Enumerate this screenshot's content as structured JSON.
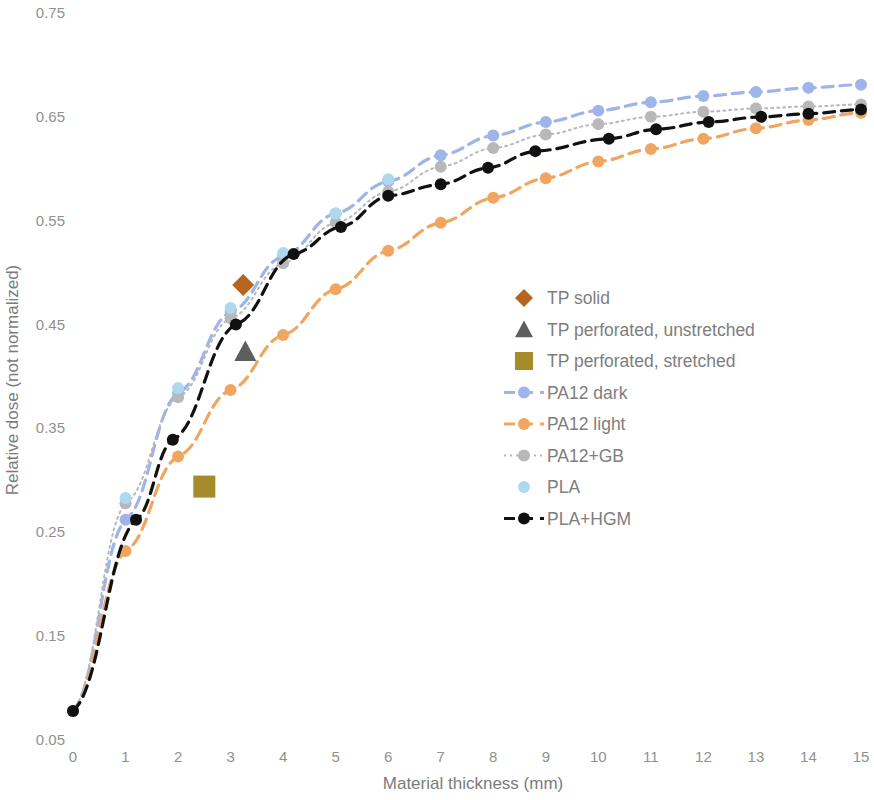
{
  "chart_data": {
    "type": "scatter",
    "title": "",
    "xlabel": "Material thickness (mm)",
    "ylabel": "Relative dose  (not normalized)",
    "xlim": [
      0,
      15
    ],
    "ylim": [
      0.05,
      0.75
    ],
    "xticks": [
      "0",
      "1",
      "2",
      "3",
      "4",
      "5",
      "6",
      "7",
      "8",
      "9",
      "10",
      "11",
      "12",
      "13",
      "14",
      "15"
    ],
    "yticks": [
      "0.05",
      "0.15",
      "0.25",
      "0.35",
      "0.45",
      "0.55",
      "0.65",
      "0.75"
    ],
    "grid": false,
    "legend_position": "center",
    "series": [
      {
        "name": "TP solid",
        "marker": "diamond",
        "color": "#b5651d",
        "line": "none",
        "points": [
          [
            3.24,
            0.488
          ]
        ]
      },
      {
        "name": "TP perforated, unstretched",
        "marker": "triangle",
        "color": "#5e5e5e",
        "line": "none",
        "points": [
          [
            3.28,
            0.424
          ]
        ]
      },
      {
        "name": "TP perforated, stretched",
        "marker": "square",
        "color": "#a68b2a",
        "line": "none",
        "points": [
          [
            2.5,
            0.294
          ]
        ]
      },
      {
        "name": "PA12 dark",
        "marker": "circle",
        "color": "#9fb4e8",
        "line": "dashed",
        "points": [
          [
            0.0,
            0.078
          ],
          [
            1.0,
            0.262
          ],
          [
            2.0,
            0.384
          ],
          [
            3.0,
            0.462
          ],
          [
            4.0,
            0.516
          ],
          [
            5.0,
            0.557
          ],
          [
            6.0,
            0.588
          ],
          [
            7.0,
            0.613
          ],
          [
            8.0,
            0.632
          ],
          [
            9.0,
            0.645
          ],
          [
            10.0,
            0.656
          ],
          [
            11.0,
            0.664
          ],
          [
            12.0,
            0.67
          ],
          [
            13.0,
            0.674
          ],
          [
            14.0,
            0.678
          ],
          [
            15.0,
            0.681
          ]
        ]
      },
      {
        "name": "PA12 light",
        "marker": "circle",
        "color": "#f0a661",
        "line": "dashed",
        "points": [
          [
            0.0,
            0.078
          ],
          [
            1.0,
            0.232
          ],
          [
            2.0,
            0.323
          ],
          [
            3.0,
            0.387
          ],
          [
            4.0,
            0.44
          ],
          [
            5.0,
            0.484
          ],
          [
            6.0,
            0.521
          ],
          [
            7.0,
            0.548
          ],
          [
            8.0,
            0.572
          ],
          [
            9.0,
            0.591
          ],
          [
            10.0,
            0.607
          ],
          [
            11.0,
            0.619
          ],
          [
            12.0,
            0.629
          ],
          [
            13.0,
            0.639
          ],
          [
            14.0,
            0.647
          ],
          [
            15.0,
            0.654
          ]
        ]
      },
      {
        "name": "PA12+GB",
        "marker": "circle",
        "color": "#b8b8b8",
        "line": "dotted",
        "points": [
          [
            0.0,
            0.078
          ],
          [
            1.0,
            0.278
          ],
          [
            2.0,
            0.38
          ],
          [
            3.0,
            0.456
          ],
          [
            4.0,
            0.509
          ],
          [
            5.0,
            0.548
          ],
          [
            6.0,
            0.578
          ],
          [
            7.0,
            0.602
          ],
          [
            8.0,
            0.62
          ],
          [
            9.0,
            0.633
          ],
          [
            10.0,
            0.643
          ],
          [
            11.0,
            0.65
          ],
          [
            12.0,
            0.655
          ],
          [
            13.0,
            0.658
          ],
          [
            14.0,
            0.66
          ],
          [
            15.0,
            0.662
          ]
        ]
      },
      {
        "name": "PLA",
        "marker": "circle",
        "color": "#add9f0",
        "line": "none",
        "points": [
          [
            0.0,
            0.078
          ],
          [
            1.0,
            0.283
          ],
          [
            2.0,
            0.389
          ],
          [
            3.0,
            0.466
          ],
          [
            4.0,
            0.519
          ],
          [
            5.0,
            0.557
          ],
          [
            6.0,
            0.59
          ]
        ]
      },
      {
        "name": "PLA+HGM",
        "marker": "circle",
        "color": "#111111",
        "line": "dashed",
        "points": [
          [
            0.0,
            0.078
          ],
          [
            1.2,
            0.262
          ],
          [
            1.9,
            0.339
          ],
          [
            3.1,
            0.45
          ],
          [
            4.2,
            0.518
          ],
          [
            5.1,
            0.544
          ],
          [
            6.0,
            0.574
          ],
          [
            7.0,
            0.585
          ],
          [
            7.9,
            0.601
          ],
          [
            8.8,
            0.617
          ],
          [
            10.2,
            0.629
          ],
          [
            11.1,
            0.638
          ],
          [
            12.1,
            0.645
          ],
          [
            13.1,
            0.65
          ],
          [
            14.0,
            0.653
          ],
          [
            15.0,
            0.657
          ]
        ]
      }
    ],
    "legend": [
      {
        "label": "TP solid",
        "marker": "diamond",
        "color": "#b5651d",
        "line": "none"
      },
      {
        "label": "TP perforated, unstretched",
        "marker": "triangle",
        "color": "#5e5e5e",
        "line": "none"
      },
      {
        "label": "TP perforated, stretched",
        "marker": "square",
        "color": "#a68b2a",
        "line": "none"
      },
      {
        "label": "PA12 dark",
        "marker": "circle",
        "color": "#9fb4e8",
        "line": "dashed"
      },
      {
        "label": "PA12 light",
        "marker": "circle",
        "color": "#f0a661",
        "line": "dashed"
      },
      {
        "label": "PA12+GB",
        "marker": "circle",
        "color": "#b8b8b8",
        "line": "dotted"
      },
      {
        "label": "PLA",
        "marker": "circle",
        "color": "#add9f0",
        "line": "none"
      },
      {
        "label": "PLA+HGM",
        "marker": "circle",
        "color": "#111111",
        "line": "dashed"
      }
    ]
  }
}
